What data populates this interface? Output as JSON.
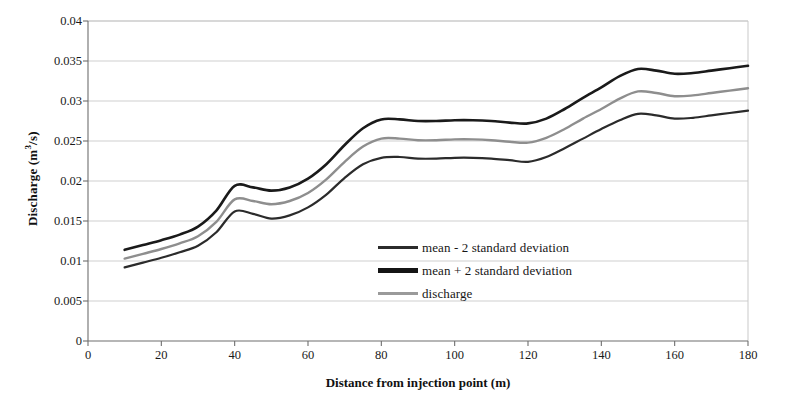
{
  "chart_data": {
    "type": "line",
    "title": "",
    "xlabel": "Distance from injection  point (m)",
    "ylabel": "Discharge (m³/s)",
    "xlabel_plain": "Distance from injection point (m)",
    "ylabel_base": "Discharge (m",
    "ylabel_sup": "3",
    "ylabel_tail": "/s)",
    "xlim": [
      0,
      180
    ],
    "ylim": [
      0,
      0.04
    ],
    "xticks": [
      0,
      20,
      40,
      60,
      80,
      100,
      120,
      140,
      160,
      180
    ],
    "xtick_labels": [
      "0",
      "20",
      "40",
      "60",
      "80",
      "100",
      "120",
      "140",
      "160",
      "180"
    ],
    "yticks": [
      0,
      0.005,
      0.01,
      0.015,
      0.02,
      0.025,
      0.03,
      0.035,
      0.04
    ],
    "ytick_labels": [
      "0",
      "0.005",
      "0.01",
      "0.015",
      "0.02",
      "0.025",
      "0.03",
      "0.035",
      "0.04"
    ],
    "grid": "horizontal",
    "legend_position": "center-right-inside",
    "x": [
      10,
      15,
      20,
      25,
      30,
      35,
      40,
      45,
      50,
      55,
      60,
      65,
      70,
      75,
      80,
      85,
      90,
      95,
      100,
      105,
      110,
      115,
      120,
      125,
      130,
      135,
      140,
      145,
      150,
      155,
      160,
      165,
      170,
      175,
      180
    ],
    "series": [
      {
        "name": "mean + 2 standard deviation",
        "color": "#1a1a1a",
        "width": 2.6,
        "values": [
          0.0114,
          0.012,
          0.0126,
          0.0133,
          0.0143,
          0.0163,
          0.0194,
          0.0192,
          0.0188,
          0.0192,
          0.0203,
          0.0221,
          0.0245,
          0.0266,
          0.0277,
          0.0277,
          0.0275,
          0.0275,
          0.0276,
          0.0276,
          0.0275,
          0.0273,
          0.0272,
          0.0278,
          0.029,
          0.0304,
          0.0317,
          0.0331,
          0.034,
          0.0338,
          0.0334,
          0.0335,
          0.0338,
          0.0341,
          0.0344
        ]
      },
      {
        "name": "discharge",
        "color": "#8e8e8e",
        "width": 2.4,
        "values": [
          0.0103,
          0.0109,
          0.0115,
          0.0122,
          0.0131,
          0.0149,
          0.0177,
          0.0175,
          0.0171,
          0.0175,
          0.0185,
          0.0202,
          0.0224,
          0.0243,
          0.0253,
          0.0253,
          0.0251,
          0.0251,
          0.0252,
          0.0252,
          0.0251,
          0.0249,
          0.0248,
          0.0254,
          0.0265,
          0.0278,
          0.029,
          0.0303,
          0.0312,
          0.031,
          0.0306,
          0.0307,
          0.031,
          0.0313,
          0.0316
        ]
      },
      {
        "name": "mean - 2 standard deviation",
        "color": "#2b2b2b",
        "width": 2.2,
        "values": [
          0.0092,
          0.0098,
          0.0104,
          0.0111,
          0.0119,
          0.0136,
          0.0162,
          0.0159,
          0.0153,
          0.0157,
          0.0167,
          0.0183,
          0.0204,
          0.0221,
          0.0229,
          0.023,
          0.0228,
          0.0228,
          0.0229,
          0.0229,
          0.0228,
          0.0226,
          0.0224,
          0.023,
          0.0241,
          0.0253,
          0.0265,
          0.0276,
          0.0284,
          0.0282,
          0.0278,
          0.0279,
          0.0282,
          0.0285,
          0.0288
        ]
      }
    ],
    "legend": [
      {
        "label": "mean - 2 standard deviation",
        "color": "#2b2b2b",
        "thickness": 3
      },
      {
        "label": "mean + 2 standard deviation",
        "color": "#141414",
        "thickness": 5
      },
      {
        "label": "discharge",
        "color": "#9a9a9a",
        "thickness": 3
      }
    ],
    "colors": {
      "axis": "#6e6e6e",
      "grid": "#c9c9c9",
      "text": "#1a1a1a",
      "background": "#ffffff"
    }
  }
}
